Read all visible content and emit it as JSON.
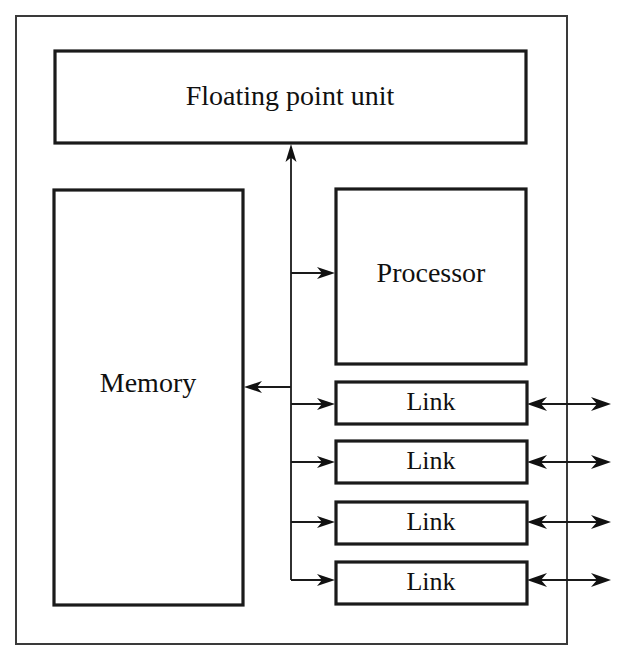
{
  "diagram": {
    "background_color": "#ffffff",
    "stroke_color": "#1a1a1a",
    "outer_chip": {
      "name": "chip-boundary",
      "label": "",
      "x": 15,
      "y": 15,
      "width": 553,
      "height": 630
    },
    "blocks": [
      {
        "id": "fpu",
        "label": "Floating point unit",
        "x": 55,
        "y": 51,
        "width": 471,
        "height": 92
      },
      {
        "id": "memory",
        "label": "Memory",
        "x": 54,
        "y": 190,
        "width": 189,
        "height": 415
      },
      {
        "id": "processor",
        "label": "Processor",
        "x": 336,
        "y": 189,
        "width": 190,
        "height": 175
      },
      {
        "id": "link1",
        "label": "Link",
        "x": 336,
        "y": 382,
        "width": 191,
        "height": 42
      },
      {
        "id": "link2",
        "label": "Link",
        "x": 336,
        "y": 441,
        "width": 191,
        "height": 42
      },
      {
        "id": "link3",
        "label": "Link",
        "x": 336,
        "y": 502,
        "width": 191,
        "height": 42
      },
      {
        "id": "link4",
        "label": "Link",
        "x": 336,
        "y": 562,
        "width": 191,
        "height": 42
      }
    ],
    "bus": {
      "id": "internal-bus",
      "x": 291,
      "top_y": 152,
      "bottom_y": 580
    },
    "connections": [
      {
        "id": "bus-to-fpu",
        "from": "bus",
        "to": "fpu",
        "direction": "up",
        "arrowheads": 1
      },
      {
        "id": "bus-to-processor",
        "from": "bus",
        "to": "processor",
        "direction": "right",
        "arrowheads": 1
      },
      {
        "id": "bus-to-memory",
        "from": "bus",
        "to": "memory",
        "direction": "left",
        "arrowheads": 1
      },
      {
        "id": "bus-to-link1",
        "from": "bus",
        "to": "link1",
        "direction": "right",
        "arrowheads": 1
      },
      {
        "id": "bus-to-link2",
        "from": "bus",
        "to": "link2",
        "direction": "right",
        "arrowheads": 1
      },
      {
        "id": "bus-to-link3",
        "from": "bus",
        "to": "link3",
        "direction": "right",
        "arrowheads": 1
      },
      {
        "id": "bus-to-link4",
        "from": "bus",
        "to": "link4",
        "direction": "right",
        "arrowheads": 1
      },
      {
        "id": "link1-external",
        "from": "link1",
        "to": "external",
        "direction": "bidirectional",
        "arrowheads": 2
      },
      {
        "id": "link2-external",
        "from": "link2",
        "to": "external",
        "direction": "bidirectional",
        "arrowheads": 2
      },
      {
        "id": "link3-external",
        "from": "link3",
        "to": "external",
        "direction": "bidirectional",
        "arrowheads": 2
      },
      {
        "id": "link4-external",
        "from": "link4",
        "to": "external",
        "direction": "bidirectional",
        "arrowheads": 2
      }
    ]
  }
}
